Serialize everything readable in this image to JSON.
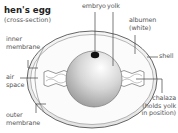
{
  "diagram": {
    "title": "hen's egg",
    "subtitle": "(cross-section)",
    "labels": {
      "embryo": "embryo",
      "yolk": "yolk",
      "albumen_line1": "albumen",
      "albumen_line2": "(white)",
      "shell": "shell",
      "inner_membrane_line1": "inner",
      "inner_membrane_line2": "membrane",
      "air_space_line1": "air",
      "air_space_line2": "space",
      "outer_membrane_line1": "outer",
      "outer_membrane_line2": "membrane",
      "chalaza_line1": "chalaza",
      "chalaza_line2": "(holds yolk",
      "chalaza_line3": "in position)"
    },
    "colors": {
      "shell_fill": "#f1f1f1",
      "albumen_fill": "#fafafa",
      "yolk_light": "#ffffff",
      "yolk_dark": "#9a9a9a",
      "embryo": "#111111",
      "line": "#444444"
    }
  }
}
